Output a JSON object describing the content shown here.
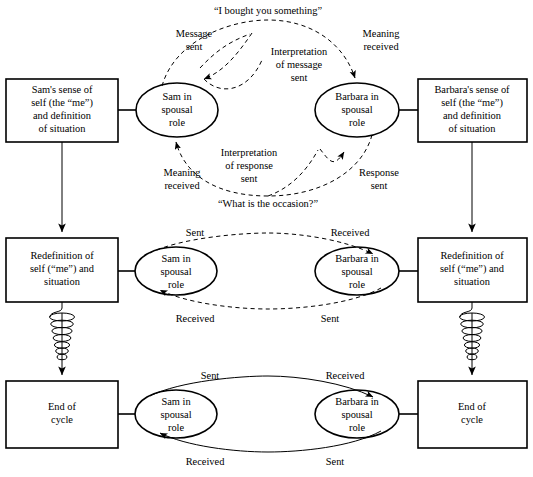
{
  "diagram": {
    "stroke_color": "#000000",
    "background_color": "#ffffff"
  },
  "rows": {
    "top": {
      "left_box": [
        "Sam's sense of",
        "self (the “me”)",
        "and definition",
        "of situation"
      ],
      "left_oval": [
        "Sam in",
        "spousal",
        "role"
      ],
      "right_oval": [
        "Barbara in",
        "spousal",
        "role"
      ],
      "right_box": [
        "Barbara's sense of",
        "self (the “me”)",
        "and definition",
        "of situation"
      ]
    },
    "middle": {
      "left_box": [
        "Redefinition of",
        "self (“me”) and",
        "situation"
      ],
      "left_oval": [
        "Sam in",
        "spousal",
        "role"
      ],
      "right_oval": [
        "Barbara in",
        "spousal",
        "role"
      ],
      "right_box": [
        "Redefinition of",
        "self (“me”) and",
        "situation"
      ]
    },
    "bottom": {
      "left_box": [
        "End of",
        "cycle"
      ],
      "left_oval": [
        "Sam in",
        "spousal",
        "role"
      ],
      "right_oval": [
        "Barbara in",
        "spousal",
        "role"
      ],
      "right_box": [
        "End of",
        "cycle"
      ]
    }
  },
  "labels": {
    "top_quote": "“I bought you something”",
    "bottom_quote": "“What is the occasion?”",
    "message_sent": [
      "Message",
      "sent"
    ],
    "meaning_received_top": [
      "Meaning",
      "received"
    ],
    "interpretation_of_message_sent": [
      "Interpretation",
      "of message",
      "sent"
    ],
    "interpretation_of_response_sent": [
      "Interpretation",
      "of response",
      "sent"
    ],
    "meaning_received_bottom": [
      "Meaning",
      "received"
    ],
    "response_sent": [
      "Response",
      "sent"
    ],
    "middle_sent_left": "Sent",
    "middle_received_right": "Received",
    "middle_received_left": "Received",
    "middle_sent_right": "Sent",
    "bottom_sent_left": "Sent",
    "bottom_received_right": "Received",
    "bottom_received_left": "Received",
    "bottom_sent_right": "Sent"
  }
}
